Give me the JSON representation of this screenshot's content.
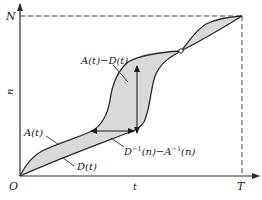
{
  "diagram": {
    "axes": {
      "x_label": "t",
      "y_label": "n",
      "origin_label": "O",
      "x_end_label": "T",
      "y_end_label": "N"
    },
    "curves": {
      "arrivals_label": "A(t)",
      "departures_label": "D(t)"
    },
    "annotations": {
      "vertical_difference": "A(t)−D(t)",
      "horizontal_difference_D": "D",
      "horizontal_difference_sup1": "−1",
      "horizontal_difference_mid": "(n)−A",
      "horizontal_difference_sup2": "−1",
      "horizontal_difference_end": "(n)",
      "horizontal_difference_full": "D⁻¹(n)−A⁻¹(n)"
    },
    "colors": {
      "stroke": "#2a2a2a",
      "fill": "#d9d9d9",
      "dash": "#444444",
      "background": "#ffffff"
    }
  }
}
